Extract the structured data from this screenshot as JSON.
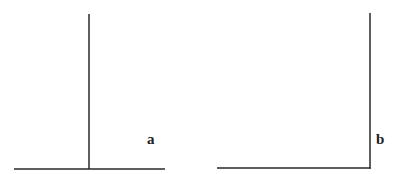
{
  "colors": {
    "background": "#ffffff",
    "line": "#2a2a2a",
    "label": "#222222"
  },
  "figures": [
    {
      "id": "a",
      "label": "a",
      "description": "inverted-T: vertical line meeting horizontal baseline at interior point",
      "vertical": {
        "x": 89,
        "y1": 14,
        "y2": 169
      },
      "horizontal": {
        "y": 169,
        "x1": 14,
        "x2": 165
      },
      "label_pos": {
        "x": 147,
        "y": 132
      }
    },
    {
      "id": "b",
      "label": "b",
      "description": "L-shape: vertical line meeting horizontal baseline at its right end",
      "vertical": {
        "x": 370,
        "y1": 13,
        "y2": 168
      },
      "horizontal": {
        "y": 168,
        "x1": 217,
        "x2": 370
      },
      "label_pos": {
        "x": 376,
        "y": 132
      }
    }
  ]
}
